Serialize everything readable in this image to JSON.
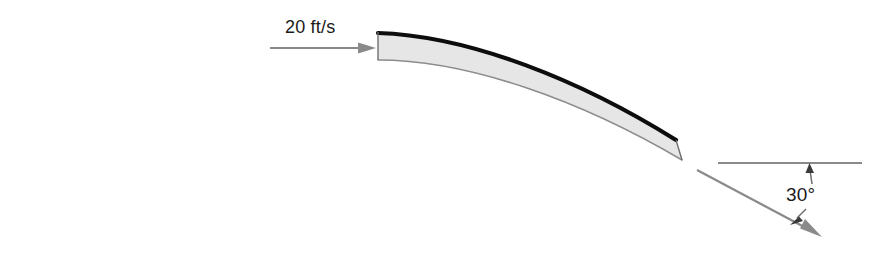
{
  "figure": {
    "background_color": "#ffffff"
  },
  "annotations": {
    "inlet_velocity_label": "20 ft/s",
    "deflection_angle_label": "30°"
  },
  "colors": {
    "vane_top_edge": "#0d0d0d",
    "vane_fill": "#e6e6e6",
    "vane_bottom_edge": "#8c8c8c",
    "arrow": "#8a8a8a",
    "reference_line": "#8a8a8a",
    "text": "#1a1a1a"
  },
  "geometry": {
    "inlet_arrow": {
      "x1": 270,
      "y1": 48,
      "x2": 376,
      "y2": 48
    },
    "outlet_arrow": {
      "x1": 697,
      "y1": 170,
      "x2": 822,
      "y2": 237,
      "angle_degrees": 30
    },
    "reference_line": {
      "x1": 718,
      "y1": 163,
      "x2": 862,
      "y2": 163
    },
    "vane_inlet_edge": {
      "x": 378,
      "y_top": 33,
      "y_bottom": 60
    },
    "vane_outlet_edge": {
      "x": 682,
      "y_top": 140,
      "y_bottom": 160
    }
  }
}
